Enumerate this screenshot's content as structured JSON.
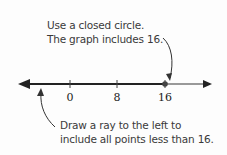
{
  "top_note": {
    "line1": "Use a closed circle.",
    "line2": "The graph includes 16."
  },
  "bottom_note": {
    "line1": "Draw a ray to the left to",
    "line2": "include all points less than 16."
  },
  "number_line": {
    "ticks": [
      {
        "value": "0",
        "x": 70
      },
      {
        "value": "8",
        "x": 117
      },
      {
        "value": "16",
        "x": 165
      }
    ],
    "closed_point": "16",
    "ray_direction": "left",
    "colors": {
      "shaded": "#222222",
      "unshaded": "#777777",
      "point": "#444444",
      "annotation": "#333333"
    }
  }
}
